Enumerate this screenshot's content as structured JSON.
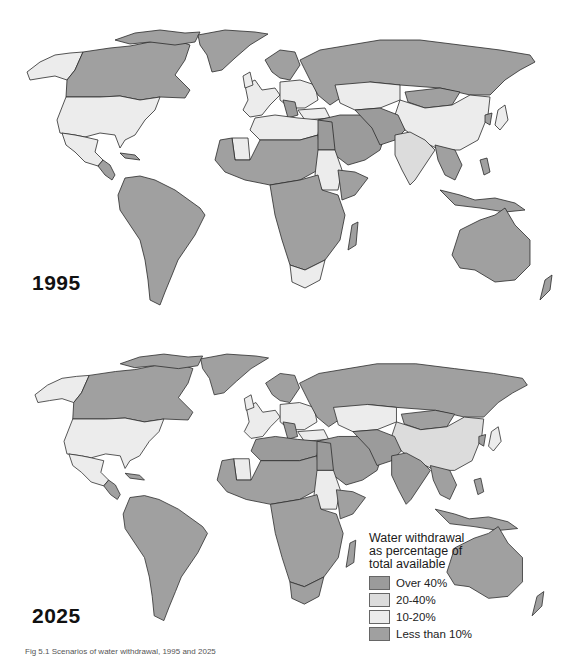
{
  "figure": {
    "caption": "Fig 5.1 Scenarios of water withdrawal, 1995 and 2025"
  },
  "panels": [
    {
      "year_label": "1995"
    },
    {
      "year_label": "2025"
    }
  ],
  "legend": {
    "title_line1": "Water withdrawal",
    "title_line2": "as percentage of",
    "title_line3": "total available",
    "items": [
      {
        "label": "Over 40%",
        "color": "#9b9b9b"
      },
      {
        "label": "20-40%",
        "color": "#dcdcdc"
      },
      {
        "label": "10-20%",
        "color": "#ececec"
      },
      {
        "label": "Less than 10%",
        "color": "#a0a0a0"
      }
    ]
  },
  "map_regions_1995": {
    "North America - Canada": "Less than 10%",
    "North America - USA": "10-20%",
    "Alaska": "10-20%",
    "Mexico": "10-20%",
    "Greenland": "Less than 10%",
    "South America": "Less than 10%",
    "Europe (west)": "10-20%",
    "Europe (east)": "10-20%",
    "Russia": "Less than 10%",
    "Kazakhstan": "10-20%",
    "China": "10-20%",
    "India": "20-40%",
    "Middle East": "Over 40%",
    "North Africa (Algeria/Libya)": "10-20%",
    "Sub-Saharan Africa": "Less than 10%",
    "Sudan": "10-20%",
    "South Africa": "10-20%",
    "Southeast Asia": "Less than 10%",
    "Australia": "Less than 10%"
  },
  "map_regions_2025": {
    "North America - Canada": "Less than 10%",
    "North America - USA": "10-20%",
    "Alaska": "10-20%",
    "Mexico": "10-20%",
    "Greenland": "Less than 10%",
    "South America": "Less than 10%",
    "Europe (west)": "10-20%",
    "Europe (east)": "10-20%",
    "Russia": "Less than 10%",
    "Kazakhstan": "10-20%",
    "China": "20-40%",
    "India": "Over 40%",
    "Middle East": "Over 40%",
    "North Africa (Algeria/Libya)": "Over 40%",
    "Sub-Saharan Africa": "Less than 10%",
    "Sudan": "10-20%",
    "Southeast Asia": "Less than 10%",
    "Australia": "Less than 10%"
  }
}
